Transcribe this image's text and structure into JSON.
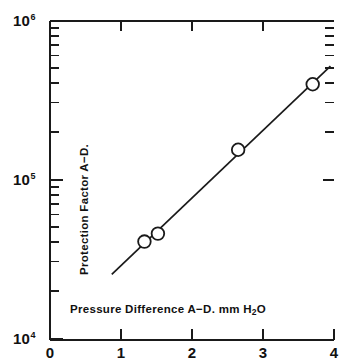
{
  "chart_data": {
    "type": "scatter",
    "title": "",
    "xlabel": "Pressure  Difference  A−D. mm H₂O",
    "ylabel": "Protection Factor A−D.",
    "xscale": "linear",
    "yscale": "log",
    "xlim": [
      0,
      4
    ],
    "ylim": [
      10000,
      1000000
    ],
    "grid": false,
    "legend": null,
    "xticks": [
      "0",
      "1",
      "2",
      "3",
      "4"
    ],
    "xtick_values": [
      0,
      1,
      2,
      3,
      4
    ],
    "ytick_labels": [
      "10",
      "10",
      "10"
    ],
    "ytick_exponents": [
      "4",
      "5",
      "6"
    ],
    "ytick_values": [
      10000,
      100000,
      1000000
    ],
    "marker_style": "open-circle",
    "series": [
      {
        "name": "Protection Factor A−D.",
        "points": [
          {
            "x": 1.33,
            "y": 41000
          },
          {
            "x": 1.52,
            "y": 46000
          },
          {
            "x": 2.65,
            "y": 155000
          },
          {
            "x": 3.7,
            "y": 400000
          }
        ]
      }
    ],
    "fit_line": {
      "type": "log-linear",
      "x_start": 0.87,
      "y_start": 25500,
      "x_end": 3.95,
      "y_end": 520000
    },
    "colors": {
      "ink": "#1a1a1a",
      "background": "#ffffff",
      "marker_fill": "#ffffff"
    }
  },
  "axis": {
    "x_title": "Pressure  Difference  A−D. mm H",
    "x_title_sub": "2",
    "x_title_tail": "O",
    "y_title": "Protection Factor A−D.",
    "decade_mantissa": "10",
    "exp_top": "6",
    "exp_mid": "5",
    "exp_bottom": "4",
    "xtick_0": "0",
    "xtick_1": "1",
    "xtick_2": "2",
    "xtick_3": "3",
    "xtick_4": "4"
  }
}
